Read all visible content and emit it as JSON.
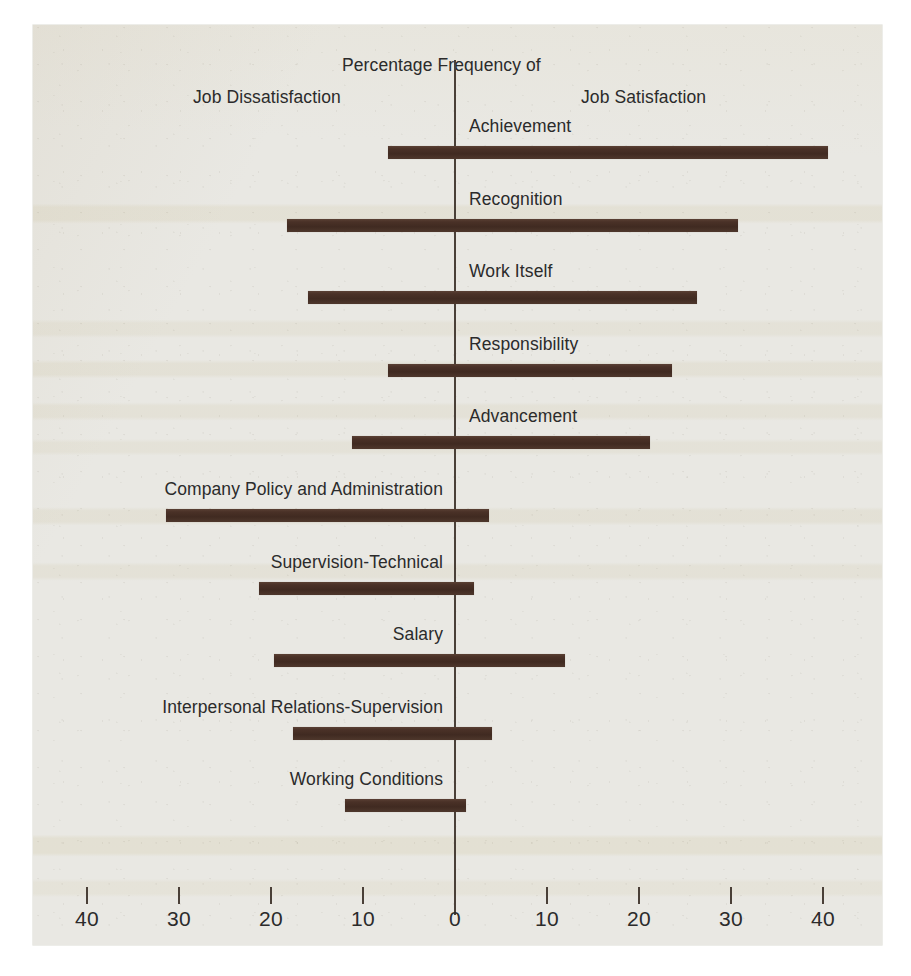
{
  "figure": {
    "header_title": "Percentage Frequency of",
    "left_heading": "Job Dissatisfaction",
    "right_heading": "Job Satisfaction"
  },
  "chart_data": {
    "type": "bar",
    "orientation": "horizontal-diverging",
    "title": "Percentage Frequency of",
    "subtitle_left": "Job Dissatisfaction",
    "subtitle_right": "Job Satisfaction",
    "xlabel": "",
    "ylabel": "",
    "xlim": [
      -45,
      45
    ],
    "grid": false,
    "legend": "none",
    "bar_color": "#452e24",
    "axis_color": "#4a4038",
    "background_color": "#e9e8e3",
    "tick_positions": [
      -40,
      -30,
      -20,
      -10,
      0,
      10,
      20,
      30,
      40
    ],
    "tick_labels": [
      "40",
      "30",
      "20",
      "10",
      "0",
      "10",
      "20",
      "30",
      "40"
    ],
    "categories": [
      "Achievement",
      "Recognition",
      "Work Itself",
      "Responsibility",
      "Advancement",
      "Company Policy and Administration",
      "Supervision-Technical",
      "Salary",
      "Interpersonal Relations-Supervision",
      "Working Conditions"
    ],
    "series": [
      {
        "name": "Job Dissatisfaction (percentage frequency, left of zero)",
        "values": [
          7.3,
          18.3,
          16.0,
          7.3,
          11.2,
          31.4,
          21.3,
          19.7,
          17.6,
          12.0
        ]
      },
      {
        "name": "Job Satisfaction (percentage frequency, right of zero)",
        "values": [
          40.5,
          30.8,
          26.3,
          23.6,
          21.2,
          3.7,
          2.1,
          12.0,
          4.0,
          1.2
        ]
      }
    ],
    "bars": [
      {
        "label": "Achievement",
        "left": -7.3,
        "right": 40.5,
        "label_side": "right"
      },
      {
        "label": "Recognition",
        "left": -18.3,
        "right": 30.8,
        "label_side": "right"
      },
      {
        "label": "Work Itself",
        "left": -16.0,
        "right": 26.3,
        "label_side": "right"
      },
      {
        "label": "Responsibility",
        "left": -7.3,
        "right": 23.6,
        "label_side": "right"
      },
      {
        "label": "Advancement",
        "left": -11.2,
        "right": 21.2,
        "label_side": "right"
      },
      {
        "label": "Company Policy and Administration",
        "left": -31.4,
        "right": 3.7,
        "label_side": "left"
      },
      {
        "label": "Supervision-Technical",
        "left": -21.3,
        "right": 2.1,
        "label_side": "left"
      },
      {
        "label": "Salary",
        "left": -19.7,
        "right": 12.0,
        "label_side": "left"
      },
      {
        "label": "Interpersonal Relations-Supervision",
        "left": -17.6,
        "right": 4.0,
        "label_side": "left"
      },
      {
        "label": "Working Conditions",
        "left": -12.0,
        "right": 1.2,
        "label_side": "left"
      }
    ]
  }
}
